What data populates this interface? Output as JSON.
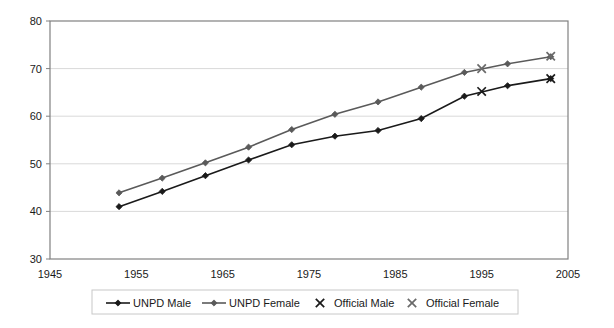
{
  "chart_data": {
    "type": "line",
    "title": "",
    "subtitle": "",
    "xlabel": "",
    "ylabel": "",
    "xlim": [
      1945,
      2005
    ],
    "ylim": [
      30,
      80
    ],
    "xticks": [
      1945,
      1955,
      1965,
      1975,
      1985,
      1995,
      2005
    ],
    "yticks": [
      30,
      40,
      50,
      60,
      70,
      80
    ],
    "grid": "horizontal",
    "legend_position": "bottom",
    "x": [
      1953,
      1958,
      1963,
      1968,
      1973,
      1978,
      1983,
      1988,
      1993,
      1998,
      2003
    ],
    "series": [
      {
        "name": "UNPD Male",
        "marker": "diamond",
        "style": "line",
        "color": "#1a1a1a",
        "values": [
          41.0,
          44.2,
          47.5,
          50.8,
          54.0,
          55.8,
          57.0,
          59.5,
          64.2,
          66.4,
          67.9
        ]
      },
      {
        "name": "UNPD Female",
        "marker": "diamond",
        "style": "line",
        "color": "#5a5a5a",
        "values": [
          43.9,
          47.0,
          50.2,
          53.5,
          57.2,
          60.4,
          63.0,
          66.1,
          69.2,
          71.0,
          72.5
        ]
      },
      {
        "name": "Official Male",
        "marker": "cross",
        "style": "markers",
        "color": "#1a1a1a",
        "x": [
          1995,
          2003
        ],
        "values": [
          65.2,
          67.9
        ]
      },
      {
        "name": "Official Female",
        "marker": "cross",
        "style": "markers",
        "color": "#6a6a6a",
        "x": [
          1995,
          2003
        ],
        "values": [
          70.0,
          72.6
        ]
      }
    ]
  },
  "axis": {
    "y_tick_labels": [
      "80",
      "70",
      "60",
      "50",
      "40",
      "30"
    ],
    "x_tick_labels": [
      "1945",
      "1955",
      "1965",
      "1975",
      "1985",
      "1995",
      "2005"
    ]
  },
  "legend": {
    "items": [
      {
        "label": "UNPD Male",
        "marker": "diamond-line",
        "color": "#1a1a1a"
      },
      {
        "label": "UNPD Female",
        "marker": "diamond-line",
        "color": "#5a5a5a"
      },
      {
        "label": "Official Male",
        "marker": "cross",
        "color": "#1a1a1a"
      },
      {
        "label": "Official Female",
        "marker": "cross",
        "color": "#6a6a6a"
      }
    ]
  },
  "colors": {
    "plot_border": "#808080",
    "gridline": "#d9d9d9",
    "background": "#ffffff",
    "male": "#1a1a1a",
    "female": "#5a5a5a"
  }
}
